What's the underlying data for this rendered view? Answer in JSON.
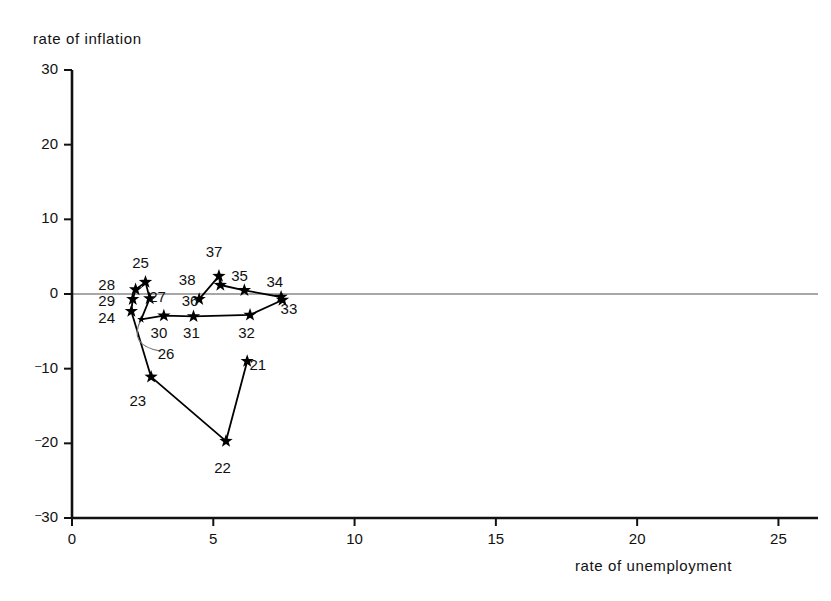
{
  "chart_data": {
    "type": "scatter",
    "title": "",
    "xlabel": "rate of unemployment",
    "ylabel": "rate of inflation",
    "xlim": [
      0,
      26.4
    ],
    "ylim": [
      -30,
      30
    ],
    "xticks": [
      "0",
      "5",
      "10",
      "15",
      "20",
      "25"
    ],
    "xtick_values": [
      0,
      5,
      10,
      15,
      20,
      25
    ],
    "yticks": [
      "30",
      "20",
      "10",
      "0",
      "-10",
      "-20",
      "-30"
    ],
    "ytick_values": [
      30,
      20,
      10,
      0,
      -10,
      -20,
      -30
    ],
    "grid": false,
    "legend": null,
    "zero_line": true,
    "marker": "star",
    "connected": true,
    "points": [
      {
        "label": "21",
        "x": 6.2,
        "y": -9.0,
        "lx": 6.6,
        "ly": -9.6
      },
      {
        "label": "22",
        "x": 5.45,
        "y": -19.7,
        "lx": 5.35,
        "ly": -23.4
      },
      {
        "label": "23",
        "x": 2.8,
        "y": -11.1,
        "lx": 2.35,
        "ly": -14.5
      },
      {
        "label": "24",
        "x": 2.1,
        "y": -2.3,
        "lx": 1.25,
        "ly": -3.3
      },
      {
        "label": "25",
        "x": 2.6,
        "y": 1.6,
        "lx": 2.45,
        "ly": 4.0
      },
      {
        "label": "26",
        "x": 2.45,
        "y": -3.4,
        "lx": 3.35,
        "ly": -8.2
      },
      {
        "label": "27",
        "x": 2.75,
        "y": -0.6,
        "lx": 3.05,
        "ly": -0.6
      },
      {
        "label": "28",
        "x": 2.25,
        "y": 0.6,
        "lx": 1.25,
        "ly": 1.1
      },
      {
        "label": "29",
        "x": 2.15,
        "y": -0.7,
        "lx": 1.25,
        "ly": -1.1
      },
      {
        "label": "30",
        "x": 3.25,
        "y": -2.9,
        "lx": 3.1,
        "ly": -5.3
      },
      {
        "label": "31",
        "x": 4.3,
        "y": -3.0,
        "lx": 4.25,
        "ly": -5.4
      },
      {
        "label": "32",
        "x": 6.3,
        "y": -2.8,
        "lx": 6.2,
        "ly": -5.3
      },
      {
        "label": "33",
        "x": 7.45,
        "y": -0.8,
        "lx": 7.7,
        "ly": -2.1
      },
      {
        "label": "34",
        "x": 7.4,
        "y": -0.4,
        "lx": 7.2,
        "ly": 1.5
      },
      {
        "label": "35",
        "x": 6.1,
        "y": 0.5,
        "lx": 5.95,
        "ly": 2.3
      },
      {
        "label": "36",
        "x": 4.5,
        "y": -0.7,
        "lx": 4.2,
        "ly": -1.1
      },
      {
        "label": "37",
        "x": 5.2,
        "y": 2.4,
        "lx": 5.05,
        "ly": 5.5
      },
      {
        "label": "38",
        "x": 5.25,
        "y": 1.2,
        "lx": 4.1,
        "ly": 1.7
      }
    ],
    "path_order": [
      "21",
      "22",
      "23",
      "24",
      "29",
      "28",
      "25",
      "27",
      "26",
      "30",
      "31",
      "32",
      "33",
      "34",
      "35",
      "38",
      "37",
      "36"
    ],
    "leader_label": "26"
  },
  "colors": {
    "axis": "#111111",
    "marker": "#000000",
    "line": "#000000",
    "zero_line": "#8a8a8a",
    "background": "#ffffff"
  }
}
